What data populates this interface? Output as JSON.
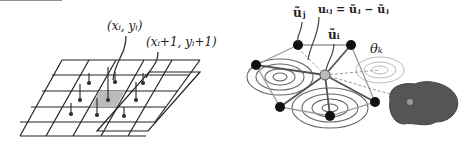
{
  "left_panel": {
    "label_a": "(xᵢ, yᵢ)",
    "label_b": "(xᵢ+1, yᵢ+1)"
  },
  "right_panel": {
    "label_uj": "ũⱼ",
    "label_uij": "uᵢⱼ = ũⱼ − ũⱼ",
    "label_ui": "ũᵢ",
    "label_theta": "θₖ"
  }
}
